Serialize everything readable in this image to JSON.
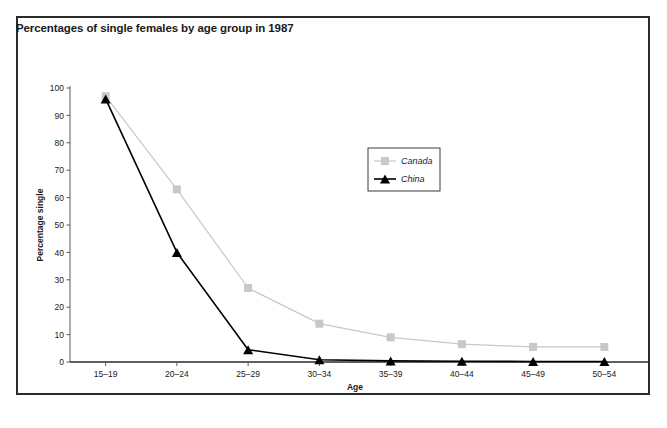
{
  "figure": {
    "title": "Percentages of single females by age group in 1987",
    "caption": ""
  },
  "chart_data": {
    "type": "line",
    "title": "Percentages of single females by age group in 1987",
    "xlabel": "Age",
    "ylabel": "Percentage single",
    "categories": [
      "15–19",
      "20–24",
      "25–29",
      "30–34",
      "35–39",
      "40–44",
      "45–49",
      "50–54"
    ],
    "ylim": [
      0,
      100
    ],
    "yticks": [
      0,
      10,
      20,
      30,
      40,
      50,
      60,
      70,
      80,
      90,
      100
    ],
    "grid": false,
    "legend_position": "upper-center",
    "series": [
      {
        "name": "Canada",
        "color": "#c8c8c8",
        "marker": "square",
        "values": [
          97,
          63,
          27,
          14,
          9,
          6.5,
          5.5,
          5.5
        ]
      },
      {
        "name": "China",
        "color": "#000000",
        "marker": "triangle",
        "values": [
          96,
          40,
          4.5,
          0.8,
          0.4,
          0.3,
          0.2,
          0.2
        ]
      }
    ]
  },
  "colors": {
    "canada": "#c8c8c8",
    "china": "#000000",
    "frame": "#2b2b2b",
    "axis": "#5a5a5a",
    "text": "#1a1a1a"
  }
}
